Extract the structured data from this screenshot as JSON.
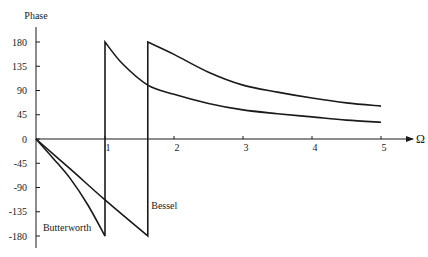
{
  "chart_data": {
    "type": "line",
    "title": "",
    "xlabel": "Ω",
    "ylabel": "Phase",
    "xlim": [
      0,
      5.5
    ],
    "ylim": [
      -180,
      180
    ],
    "x_ticks": [
      1,
      2,
      3,
      4,
      5
    ],
    "x_tick_labels": [
      "1",
      "2",
      "3",
      "4",
      "5"
    ],
    "y_ticks": [
      180,
      135,
      90,
      45,
      0,
      -45,
      -90,
      -135,
      -180
    ],
    "y_tick_labels": [
      "180",
      "135",
      "90",
      "45",
      "0",
      "-45",
      "-90",
      "-135",
      "-180"
    ],
    "grid": false,
    "legend": "inline labels",
    "series": [
      {
        "name": "Butterworth",
        "label_position": {
          "x": 0.1,
          "y": -165
        },
        "segments": [
          {
            "x": [
              0,
              0.25,
              0.5,
              0.75,
              1.0
            ],
            "y": [
              0,
              -36,
              -74,
              -122,
              -180
            ]
          },
          {
            "x": [
              1.0,
              1.25,
              1.62,
              2,
              2.5,
              3,
              3.5,
              4,
              4.5,
              5
            ],
            "y": [
              180,
              140,
              100,
              83,
              66,
              54,
              47,
              41,
              35,
              31
            ]
          }
        ]
      },
      {
        "name": "Bessel",
        "label_position": {
          "x": 1.67,
          "y": -125
        },
        "segments": [
          {
            "x": [
              0,
              0.5,
              1.0,
              1.62
            ],
            "y": [
              0,
              -56,
              -113,
              -180
            ]
          },
          {
            "x": [
              1.62,
              2,
              2.5,
              3,
              3.5,
              4,
              4.5,
              5
            ],
            "y": [
              180,
              157,
              124,
              100,
              87,
              76,
              67,
              61
            ]
          }
        ]
      }
    ]
  }
}
